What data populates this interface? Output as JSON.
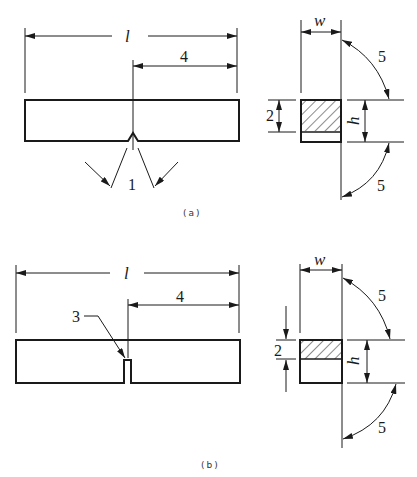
{
  "figure_a": {
    "caption": "(a)",
    "length_label": "l",
    "notch_position_label": "4",
    "notch_label": "1",
    "section": {
      "width_label": "w",
      "height_label": "h",
      "ligament_label": "2",
      "angle_label_top": "5",
      "angle_label_bottom": "5"
    }
  },
  "figure_b": {
    "caption": "(b)",
    "length_label": "l",
    "notch_position_label": "4",
    "notch_label": "3",
    "section": {
      "width_label": "w",
      "height_label": "h",
      "ligament_label": "2",
      "angle_label_top": "5",
      "angle_label_bottom": "5"
    }
  },
  "colors": {
    "line": "#1a1a1a",
    "background": "#ffffff"
  }
}
